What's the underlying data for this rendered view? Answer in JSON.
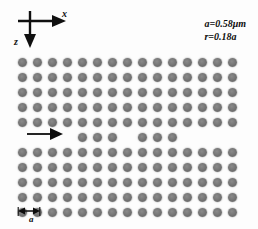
{
  "axes": {
    "x_label": "x",
    "z_label": "z"
  },
  "parameters": [
    {
      "text": "a=0.58μm"
    },
    {
      "text": "r=0.18a"
    }
  ],
  "lattice_constant": {
    "label": "a"
  },
  "colors": {
    "hole": "#747474",
    "background": "#fdfdfd",
    "ink": "#101010"
  },
  "lattice": {
    "columns": 15,
    "rows": 11,
    "origin_x": 22,
    "origin_y": 62,
    "pitch_x": 15,
    "pitch_y": 15,
    "defect_row_index": 5,
    "defect_row_present_columns": [
      4,
      5,
      6,
      8,
      9,
      10
    ],
    "hole_diameter_px": 9
  },
  "input_arrow": {
    "name": "input-light-direction"
  }
}
